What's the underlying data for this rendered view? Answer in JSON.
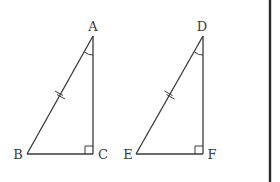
{
  "diagram": {
    "title": "",
    "triangles": [
      {
        "name": "ABC",
        "vertices": {
          "A": {
            "label": "A",
            "x": 93,
            "y": 36,
            "label_x": 93,
            "label_y": 31
          },
          "B": {
            "label": "B",
            "x": 27,
            "y": 154,
            "label_x": 18,
            "label_y": 159
          },
          "C": {
            "label": "C",
            "x": 93,
            "y": 154,
            "label_x": 102,
            "label_y": 159
          }
        },
        "right_angle_at": "C",
        "marked_angle_at": "A",
        "equal_side_mark": "AB"
      },
      {
        "name": "DEF",
        "vertices": {
          "D": {
            "label": "D",
            "x": 203,
            "y": 36,
            "label_x": 201,
            "label_y": 31
          },
          "E": {
            "label": "E",
            "x": 136,
            "y": 154,
            "label_x": 128,
            "label_y": 159
          },
          "F": {
            "label": "F",
            "x": 203,
            "y": 154,
            "label_x": 211,
            "label_y": 159
          }
        },
        "right_angle_at": "F",
        "marked_angle_at": "D",
        "equal_side_mark": "DE"
      }
    ],
    "colors": {
      "stroke": "#3a3a3a",
      "background": "#ffffff",
      "divider": "#2b2b2b"
    }
  }
}
